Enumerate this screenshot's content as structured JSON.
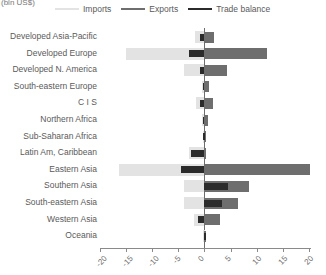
{
  "unit_label": "(bln US$)",
  "legend": {
    "position": "top",
    "items": [
      {
        "label": "Imports",
        "color": "#e3e3e3",
        "name": "imports"
      },
      {
        "label": "Exports",
        "color": "#6e6e6e",
        "name": "exports"
      },
      {
        "label": "Trade balance",
        "color": "#2b2b2b",
        "name": "trade-balance"
      }
    ]
  },
  "axis": {
    "ticks": [
      -20,
      -15,
      -10,
      -5,
      0,
      5,
      10,
      15,
      20
    ],
    "tick_labels": [
      "-20",
      "-15",
      "-10",
      "-5",
      "0",
      "5",
      "10",
      "15",
      "20"
    ],
    "min": -20,
    "max": 20
  },
  "chart_data": {
    "type": "bar",
    "orientation": "horizontal",
    "title": "",
    "subtitle": "",
    "xlabel": "(bln US$)",
    "ylabel": "",
    "xlim": [
      -20,
      20
    ],
    "grid": false,
    "legend_position": "top",
    "categories": [
      "Developed Asia-Pacific",
      "Developed Europe",
      "Developed N. America",
      "South-eastern Europe",
      "C I S",
      "Northern Africa",
      "Sub-Saharan Africa",
      "Latin Am, Caribbean",
      "Eastern Asia",
      "Southern Asia",
      "South-eastern Asia",
      "Western Asia",
      "Oceania"
    ],
    "series": [
      {
        "name": "Imports",
        "color": "#e3e3e3",
        "values": [
          -1.8,
          -15.0,
          -4.0,
          -0.5,
          -1.6,
          -0.5,
          -0.3,
          -3.0,
          -16.3,
          -4.0,
          -4.0,
          -2.0,
          -0.2
        ]
      },
      {
        "name": "Exports",
        "color": "#6e6e6e",
        "values": [
          1.9,
          12.0,
          4.3,
          0.8,
          1.7,
          0.6,
          0.4,
          0.4,
          20.2,
          8.6,
          6.5,
          3.0,
          0.2
        ]
      },
      {
        "name": "Trade balance",
        "color": "#2b2b2b",
        "values": [
          -0.9,
          -3.0,
          -0.8,
          -0.3,
          -0.9,
          -0.3,
          -0.2,
          -2.6,
          -4.5,
          4.6,
          3.3,
          -1.3,
          0.1
        ]
      }
    ]
  }
}
